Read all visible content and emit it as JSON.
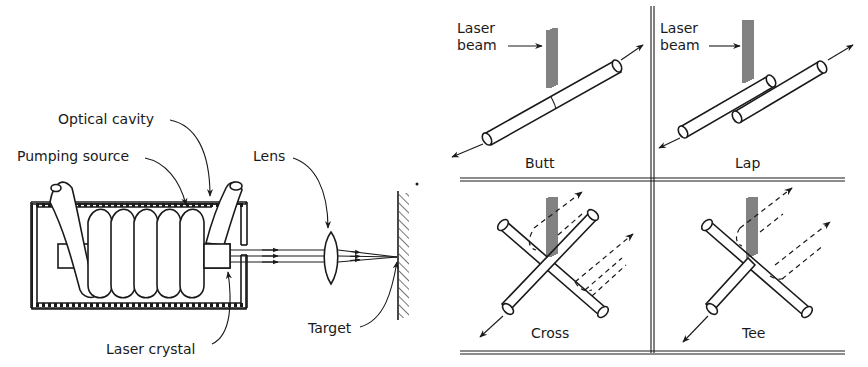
{
  "figure": {
    "left_panel": {
      "name": "laser-welding-setup",
      "labels": {
        "optical_cavity": "Optical cavity",
        "pumping_source": "Pumping source",
        "lens": "Lens",
        "laser_crystal": "Laser crystal",
        "target": "Target"
      }
    },
    "right_panel": {
      "name": "weld-joint-types",
      "laser_beam_label_line1": "Laser",
      "laser_beam_label_line2": "beam",
      "joints": [
        {
          "id": "butt",
          "label": "Butt"
        },
        {
          "id": "lap",
          "label": "Lap"
        },
        {
          "id": "cross",
          "label": "Cross"
        },
        {
          "id": "tee",
          "label": "Tee"
        }
      ]
    },
    "colors": {
      "ink": "#1a1a1a",
      "background": "#ffffff"
    }
  }
}
